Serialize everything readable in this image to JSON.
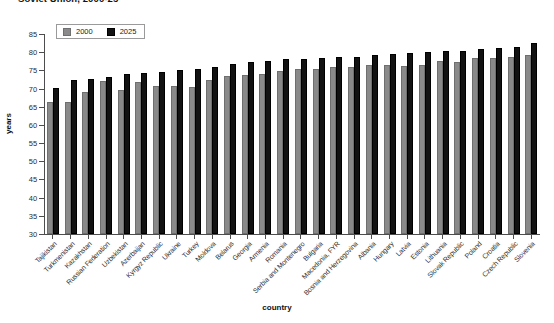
{
  "chart_data": {
    "type": "bar",
    "title": "Soviet Union, 2000-25",
    "xlabel": "country",
    "ylabel": "years",
    "ylim": [
      30,
      85
    ],
    "yticks": [
      30,
      35,
      40,
      45,
      50,
      55,
      60,
      65,
      70,
      75,
      80,
      85
    ],
    "grid": false,
    "legend_position": "top-left",
    "categories": [
      "Tajikistan",
      "Turkmenistan",
      "Kazakhstan",
      "Russian Federation",
      "Uzbekistan",
      "Azerbaijan",
      "Kyrgyz Republic",
      "Ukraine",
      "Turkey",
      "Moldova",
      "Belarus",
      "Georgia",
      "Armenia",
      "Romania",
      "Serbia and Montenegro",
      "Bulgaria",
      "Macedonia, FYR",
      "Bosnia and Herzegovina",
      "Albania",
      "Hungary",
      "Latvia",
      "Estonia",
      "Lithuania",
      "Slovak Republic",
      "Poland",
      "Croatia",
      "Czech Republic",
      "Slovenia"
    ],
    "series": [
      {
        "name": "2000",
        "color": "#8a8a8a",
        "values": [
          66.3,
          66.4,
          69.1,
          72.1,
          69.5,
          71.8,
          70.7,
          70.8,
          70.5,
          72.3,
          73.5,
          73.8,
          74.0,
          74.9,
          75.5,
          75.3,
          75.8,
          75.9,
          76.5,
          76.6,
          76.3,
          76.5,
          77.5,
          77.4,
          78.4,
          78.5,
          78.8,
          79.2
        ],
        "year": 2000
      },
      {
        "name": "2025",
        "color": "#121212",
        "values": [
          70.2,
          72.4,
          72.6,
          73.2,
          74.0,
          74.3,
          74.5,
          75.0,
          75.5,
          76.0,
          76.7,
          77.3,
          77.7,
          78.0,
          78.2,
          78.4,
          78.7,
          78.8,
          79.1,
          79.4,
          79.8,
          80.0,
          80.2,
          80.4,
          80.8,
          81.1,
          81.3,
          82.4
        ],
        "year": 2025
      }
    ]
  },
  "legend": {
    "items": [
      {
        "label": "2000",
        "swatch": "s2000"
      },
      {
        "label": "2025",
        "swatch": "s2025"
      }
    ]
  }
}
